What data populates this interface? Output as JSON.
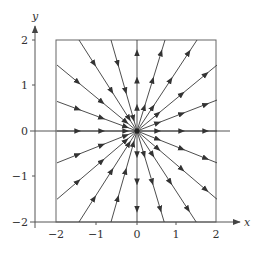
{
  "diagram": {
    "type": "phase-portrait",
    "axes": {
      "x_label": "x",
      "y_label": "y",
      "x_ticks": [
        {
          "value": -2,
          "label": "−2"
        },
        {
          "value": -1,
          "label": "−1"
        },
        {
          "value": 0,
          "label": "0"
        },
        {
          "value": 1,
          "label": "1"
        },
        {
          "value": 2,
          "label": "2"
        }
      ],
      "y_ticks": [
        {
          "value": 2,
          "label": "2"
        },
        {
          "value": 1,
          "label": "1"
        },
        {
          "value": 0,
          "label": "0"
        },
        {
          "value": -1,
          "label": "−1"
        },
        {
          "value": -2,
          "label": "−2"
        }
      ],
      "xlim": [
        -2,
        2
      ],
      "ylim": [
        -2,
        2
      ]
    },
    "trajectories": [
      {
        "from": [
          -2,
          1.45
        ],
        "to": [
          0,
          0
        ],
        "direction": "inward"
      },
      {
        "from": [
          -2,
          0.65
        ],
        "to": [
          0,
          0
        ],
        "direction": "inward"
      },
      {
        "from": [
          -2,
          0
        ],
        "to": [
          0,
          0
        ],
        "direction": "inward"
      },
      {
        "from": [
          -2,
          -0.7
        ],
        "to": [
          0,
          0
        ],
        "direction": "inward"
      },
      {
        "from": [
          -2,
          -1.5
        ],
        "to": [
          0,
          0
        ],
        "direction": "inward"
      },
      {
        "from": [
          -1.45,
          2
        ],
        "to": [
          0,
          0
        ],
        "direction": "inward"
      },
      {
        "from": [
          -0.65,
          2
        ],
        "to": [
          0,
          0
        ],
        "direction": "inward"
      },
      {
        "from": [
          -1.45,
          -2
        ],
        "to": [
          0,
          0
        ],
        "direction": "inward"
      },
      {
        "from": [
          -0.65,
          -2
        ],
        "to": [
          0,
          0
        ],
        "direction": "inward"
      },
      {
        "from": [
          0,
          0
        ],
        "to": [
          0,
          2
        ],
        "direction": "outward"
      },
      {
        "from": [
          0,
          0
        ],
        "to": [
          0,
          -2
        ],
        "direction": "outward"
      },
      {
        "from": [
          0,
          0
        ],
        "to": [
          0.7,
          2
        ],
        "direction": "outward"
      },
      {
        "from": [
          0,
          0
        ],
        "to": [
          1.5,
          2
        ],
        "direction": "outward"
      },
      {
        "from": [
          0,
          0
        ],
        "to": [
          2,
          1.45
        ],
        "direction": "outward"
      },
      {
        "from": [
          0,
          0
        ],
        "to": [
          2,
          0.68
        ],
        "direction": "outward"
      },
      {
        "from": [
          0,
          0
        ],
        "to": [
          2,
          0
        ],
        "direction": "outward"
      },
      {
        "from": [
          0,
          0
        ],
        "to": [
          2,
          -0.7
        ],
        "direction": "outward"
      },
      {
        "from": [
          0,
          0
        ],
        "to": [
          2,
          -1.5
        ],
        "direction": "outward"
      },
      {
        "from": [
          0,
          0
        ],
        "to": [
          0.68,
          -2
        ],
        "direction": "outward"
      },
      {
        "from": [
          0,
          0
        ],
        "to": [
          1.48,
          -2
        ],
        "direction": "outward"
      }
    ],
    "colors": {
      "line": "#3a3a3a",
      "axis": "#555555"
    }
  }
}
